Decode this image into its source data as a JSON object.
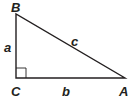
{
  "diagram": {
    "type": "right-triangle",
    "stroke_color": "#231f20",
    "background": "#ffffff",
    "vertices": [
      {
        "id": "B",
        "label": "B",
        "x": 16,
        "y": 14
      },
      {
        "id": "C",
        "label": "C",
        "x": 16,
        "y": 78
      },
      {
        "id": "A",
        "label": "A",
        "x": 125,
        "y": 78
      }
    ],
    "sides": [
      {
        "id": "a",
        "label": "a",
        "from": "B",
        "to": "C"
      },
      {
        "id": "b",
        "label": "b",
        "from": "C",
        "to": "A"
      },
      {
        "id": "c",
        "label": "c",
        "from": "B",
        "to": "A"
      }
    ],
    "right_angle_at": "C"
  },
  "labels": {
    "vertex_B": "B",
    "vertex_C": "C",
    "vertex_A": "A",
    "side_a": "a",
    "side_b": "b",
    "side_c": "c"
  }
}
